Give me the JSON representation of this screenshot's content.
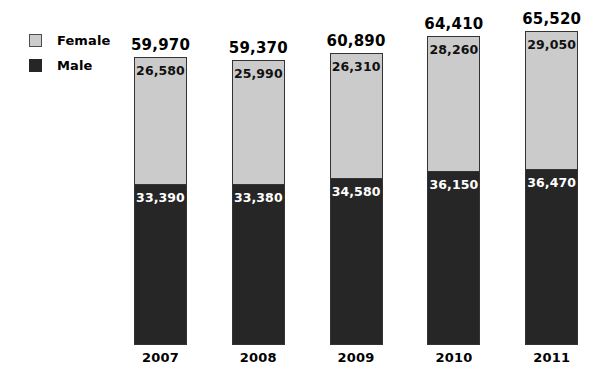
{
  "chart_data": {
    "type": "bar",
    "subtype": "stacked-vertical",
    "title": "",
    "subtitle": "",
    "xlabel": "",
    "ylabel": "",
    "grid": false,
    "axis_visible": false,
    "legend_position": "top-left",
    "categories": [
      "2007",
      "2008",
      "2009",
      "2010",
      "2011"
    ],
    "series": [
      {
        "name": "Female",
        "color": "#cbcbcb",
        "stack_position": "top",
        "values": [
          26580,
          25990,
          26310,
          28260,
          29050
        ],
        "labels": [
          "26,580",
          "25,990",
          "26,310",
          "28,260",
          "29,050"
        ]
      },
      {
        "name": "Male",
        "color": "#262626",
        "stack_position": "bottom",
        "values": [
          33390,
          33380,
          34580,
          36150,
          36470
        ],
        "labels": [
          "33,390",
          "33,380",
          "34,580",
          "36,150",
          "36,470"
        ]
      }
    ],
    "totals": [
      59970,
      59370,
      60890,
      64410,
      65520
    ],
    "total_labels": [
      "59,970",
      "59,370",
      "60,890",
      "64,410",
      "65,520"
    ],
    "ylim": [
      0,
      65520
    ]
  },
  "legend": {
    "items": [
      {
        "label": "Female",
        "color": "#cbcbcb",
        "swatch": "legend-swatch-female"
      },
      {
        "label": "Male",
        "color": "#262626",
        "swatch": "legend-swatch-male"
      }
    ]
  },
  "bars": [
    {
      "category": "2007",
      "total_label": "59,970",
      "female_label": "26,580",
      "male_label": "33,390"
    },
    {
      "category": "2008",
      "total_label": "59,370",
      "female_label": "25,990",
      "male_label": "33,380"
    },
    {
      "category": "2009",
      "total_label": "60,890",
      "female_label": "26,310",
      "male_label": "34,580"
    },
    {
      "category": "2010",
      "total_label": "64,410",
      "female_label": "28,260",
      "male_label": "36,150"
    },
    {
      "category": "2011",
      "total_label": "65,520",
      "female_label": "29,050",
      "male_label": "36,470"
    }
  ],
  "colors": {
    "female": "#cbcbcb",
    "male": "#262626",
    "bar_border": "#333333",
    "background": "#ffffff",
    "text": "#000000",
    "text_inverse": "#ffffff"
  }
}
